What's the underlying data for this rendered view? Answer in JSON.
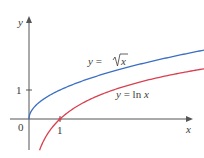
{
  "chart_data": {
    "type": "line",
    "title": "",
    "xlabel": "x",
    "ylabel": "y",
    "origin_label": "0",
    "x_ticks": [
      {
        "value": 1,
        "label": "1"
      }
    ],
    "y_ticks": [
      {
        "value": 1,
        "label": "1"
      }
    ],
    "xlim": [
      -0.9,
      5.6
    ],
    "ylim": [
      -1.1,
      3.5
    ],
    "grid": false,
    "series": [
      {
        "name": "y = √x",
        "color": "#3b6fc4",
        "function": "sqrt(x)",
        "x": [
          0,
          0.25,
          0.5,
          1,
          2,
          3,
          4,
          5,
          5.6
        ],
        "values": [
          0,
          0.5,
          0.71,
          1,
          1.41,
          1.73,
          2,
          2.24,
          2.37
        ]
      },
      {
        "name": "y = ln x",
        "color": "#d9404f",
        "function": "ln(x)",
        "x": [
          0.35,
          0.5,
          1,
          2,
          3,
          4,
          5,
          5.6
        ],
        "values": [
          -1.05,
          -0.69,
          0,
          0.69,
          1.1,
          1.39,
          1.61,
          1.72
        ]
      }
    ],
    "annotations": [
      {
        "text_prefix": "y = ",
        "text_radical": "x",
        "target": "sqrt"
      },
      {
        "text_prefix": "y = ln ",
        "text_var": "x",
        "target": "ln"
      }
    ]
  },
  "labels": {
    "y_axis": "y",
    "x_axis": "x",
    "origin": "0",
    "x_tick_1": "1",
    "y_tick_1": "1",
    "sqrt_prefix": "y = ",
    "sqrt_var": "x",
    "ln_prefix": "y = ln ",
    "ln_var": "x"
  }
}
